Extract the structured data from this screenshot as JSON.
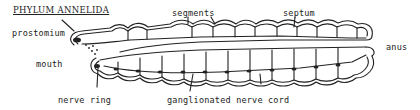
{
  "diagram": {
    "title": "PHYLUM ANNELIDA",
    "labels": {
      "prostomium": "prostomium",
      "segments": "segments",
      "septum": "septum",
      "anus": "anus",
      "mouth": "mouth",
      "nerve_ring": "nerve ring",
      "ganglionated_nerve_cord": "ganglionated nerve cord"
    },
    "colors": {
      "ink": "#222222",
      "background": "#ffffff"
    }
  }
}
